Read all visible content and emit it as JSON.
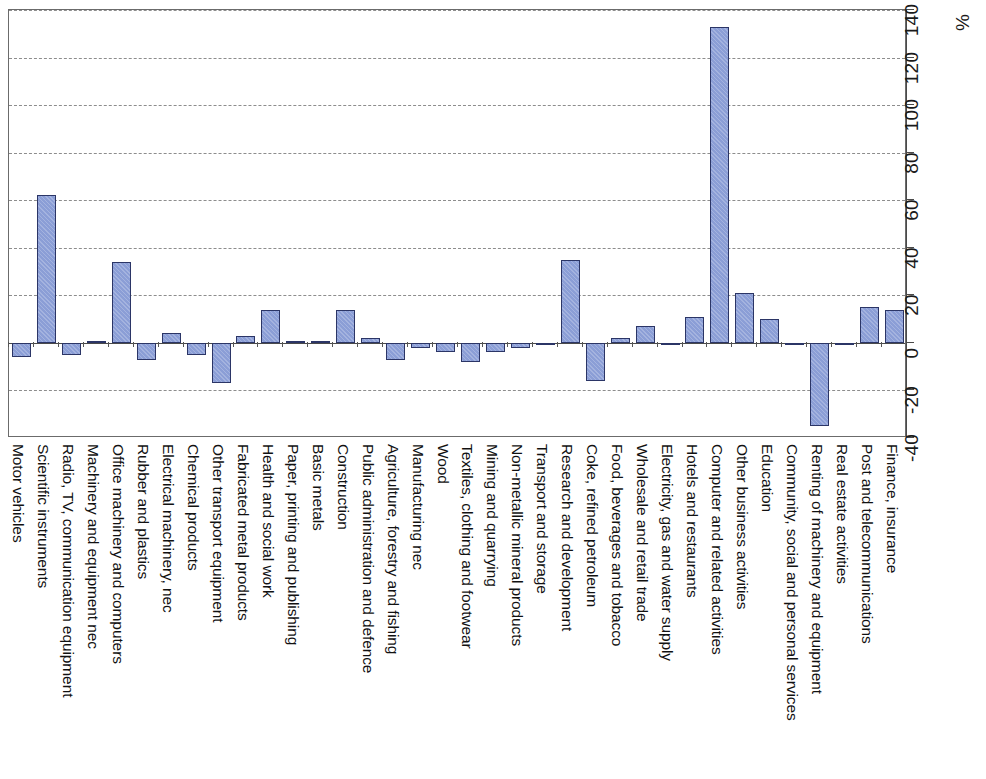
{
  "chart_data": {
    "type": "bar",
    "title": "",
    "subtitle": "",
    "xlabel": "",
    "ylabel": "%",
    "unit": "%",
    "orientation": "vertical",
    "grid": true,
    "legend": false,
    "ylim": [
      -40,
      140
    ],
    "ytick_labels": [
      "-40",
      "-20",
      "0",
      "20",
      "40",
      "60",
      "80",
      "100",
      "120",
      "140"
    ],
    "ytick_values": [
      -40,
      -20,
      0,
      20,
      40,
      60,
      80,
      100,
      120,
      140
    ],
    "bar_color": "#8b9ed6",
    "bar_border_color": "#2b3566",
    "categories": [
      "Motor vehicles",
      "Scientific instruments",
      "Radio, TV, communication equipment",
      "Machinery and equipment nec",
      "Office machinery and computers",
      "Rubber and plastics",
      "Electrical machinery, nec",
      "Chemical products",
      "Other transport equipment",
      "Fabricated metal products",
      "Health and social work",
      "Paper, printing and publishing",
      "Basic metals",
      "Construction",
      "Public administration and defence",
      "Agriculture, forestry and fishing",
      "Manufacturing nec",
      "Wood",
      "Textiles, clothing and footwear",
      "Mining and quarrying",
      "Non-metallic mineral products",
      "Transport and storage",
      "Research and development",
      "Coke, refined petroleum",
      "Food, beverages and tobacco",
      "Wholesale and retail trade",
      "Electricity, gas and water supply",
      "Hotels and restaurants",
      "Computer and related activities",
      "Other business activities",
      "Education",
      "Community, social and personal services",
      "Renting of machinery and equipment",
      "Real estate activities",
      "Post and telecommunications",
      "Finance, insurance"
    ],
    "values": [
      -6,
      62,
      -5,
      1,
      34,
      -7,
      4,
      -5,
      -17,
      3,
      14,
      1,
      1,
      14,
      2,
      -7,
      -2,
      -4,
      -8,
      -4,
      -2,
      -1,
      35,
      -16,
      2,
      7,
      -1,
      11,
      133,
      21,
      10,
      -1,
      -35,
      0,
      15,
      14
    ]
  }
}
